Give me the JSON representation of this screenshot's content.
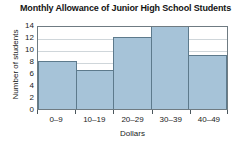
{
  "chart_data": {
    "type": "bar",
    "title": "Monthly Allowance of Junior High School Students",
    "xlabel": "Dollars",
    "ylabel": "Number of students",
    "categories": [
      "0–9",
      "10–19",
      "20–29",
      "30–39",
      "40–49"
    ],
    "values": [
      8,
      6.5,
      12,
      14,
      9
    ],
    "yticks": [
      0,
      2,
      4,
      6,
      8,
      10,
      12,
      14
    ],
    "ylim": [
      0,
      14
    ],
    "grid": true,
    "legend": null,
    "bar_color": "#a6c3d8",
    "bar_edge_color": "#5d7a8c",
    "grid_color": "#cfd6da",
    "axis_color": "#6f7b82"
  }
}
